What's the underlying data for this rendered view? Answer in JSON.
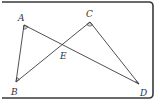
{
  "diagram": {
    "type": "geometry",
    "points": {
      "A": {
        "label": "A",
        "x": 24,
        "y": 25
      },
      "B": {
        "label": "B",
        "x": 16,
        "y": 82
      },
      "C": {
        "label": "C",
        "x": 90,
        "y": 22
      },
      "D": {
        "label": "D",
        "x": 139,
        "y": 84
      },
      "E": {
        "label": "E",
        "x": 63,
        "y": 44
      }
    },
    "segments": [
      {
        "from": "A",
        "to": "B"
      },
      {
        "from": "A",
        "to": "D"
      },
      {
        "from": "B",
        "to": "C"
      },
      {
        "from": "C",
        "to": "D"
      }
    ],
    "marked_angles": [
      "A",
      "B",
      "C",
      "D"
    ],
    "labels": {
      "A": "A",
      "B": "B",
      "C": "C",
      "D": "D",
      "E": "E"
    }
  }
}
